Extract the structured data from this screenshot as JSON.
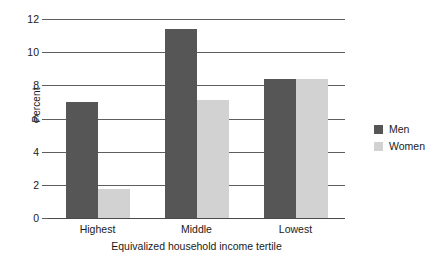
{
  "chart_data": {
    "type": "bar",
    "title": "",
    "xlabel": "Equivalized household income tertile",
    "ylabel": "Percent",
    "categories": [
      "Highest",
      "Middle",
      "Lowest"
    ],
    "series": [
      {
        "name": "Men",
        "color": "#565656",
        "values": [
          7.0,
          11.4,
          8.4
        ]
      },
      {
        "name": "Women",
        "color": "#d2d2d2",
        "values": [
          1.75,
          7.1,
          8.4
        ]
      }
    ],
    "ylim": [
      0,
      12
    ],
    "yticks": [
      0,
      2,
      4,
      6,
      8,
      10,
      12
    ],
    "ytick_labels": [
      "0",
      "2",
      "4",
      "6",
      "8",
      "10",
      "12"
    ],
    "grid": true,
    "grid_axis": "y",
    "legend_position": "right",
    "legend_entries": [
      "Men",
      "Women"
    ]
  }
}
